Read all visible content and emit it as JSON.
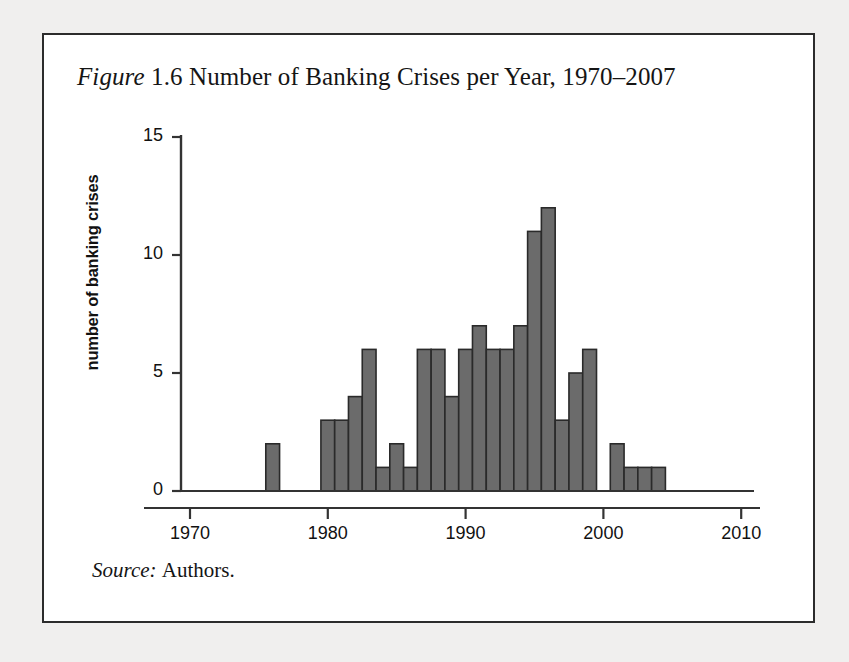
{
  "figure": {
    "label_word": "Figure",
    "number": "1.6",
    "title_rest": "Number of Banking Crises per Year, 1970–2007",
    "source_word": "Source:",
    "source_text": "Authors."
  },
  "axes": {
    "y_title": "number of banking crises",
    "y_ticks": [
      "0",
      "5",
      "10",
      "15"
    ],
    "x_ticks": [
      "1970",
      "1980",
      "1990",
      "2000",
      "2010"
    ]
  },
  "colors": {
    "bar_fill": "#6b6b6b",
    "bar_stroke": "#2a2a2a",
    "axis": "#333333",
    "page_background": "#f0efee",
    "figure_background": "#ffffff",
    "text": "#141414"
  },
  "chart_data": {
    "type": "bar",
    "xlabel": "",
    "ylabel": "number of banking crises",
    "xlim": [
      1969,
      2010.5
    ],
    "ylim": [
      0,
      15
    ],
    "xticks": [
      1970,
      1980,
      1990,
      2000,
      2010
    ],
    "yticks": [
      0,
      5,
      10,
      15
    ],
    "grid": false,
    "legend": null,
    "bar_width_years": 1,
    "categories": [
      1970,
      1971,
      1972,
      1973,
      1974,
      1975,
      1976,
      1977,
      1978,
      1979,
      1980,
      1981,
      1982,
      1983,
      1984,
      1985,
      1986,
      1987,
      1988,
      1989,
      1990,
      1991,
      1992,
      1993,
      1994,
      1995,
      1996,
      1997,
      1998,
      1999,
      2000,
      2001,
      2002,
      2003,
      2004,
      2005,
      2006,
      2007
    ],
    "values": [
      0,
      0,
      0,
      0,
      0,
      0,
      2,
      0,
      0,
      0,
      3,
      3,
      4,
      6,
      1,
      2,
      1,
      6,
      6,
      4,
      6,
      7,
      6,
      6,
      7,
      11,
      12,
      3,
      5,
      6,
      0,
      2,
      1,
      1,
      1,
      0,
      0,
      0
    ]
  }
}
